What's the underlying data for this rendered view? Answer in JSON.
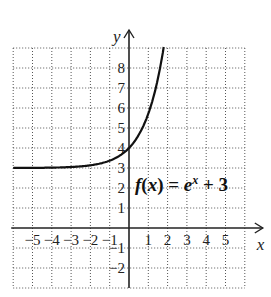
{
  "chart_data": {
    "type": "line",
    "title": "",
    "annotation": "f(x) = e^x + 3",
    "xlabel": "x",
    "ylabel": "y",
    "xlim": [
      -6,
      6
    ],
    "ylim": [
      -3,
      9
    ],
    "grid": true,
    "x_ticks": [
      "-5",
      "-4",
      "-3",
      "-2",
      "-1",
      "1",
      "2",
      "3",
      "4",
      "5"
    ],
    "y_ticks": [
      "8",
      "7",
      "6",
      "5",
      "4",
      "3",
      "2",
      "1",
      "-1",
      "-2"
    ],
    "series": [
      {
        "name": "f(x) = e^x + 3",
        "x": [
          -6,
          -5,
          -4,
          -3,
          -2,
          -1,
          0,
          0.5,
          1,
          1.5,
          1.8
        ],
        "y": [
          3.0,
          3.01,
          3.02,
          3.05,
          3.14,
          3.37,
          4.0,
          4.65,
          5.72,
          7.48,
          9.05
        ]
      }
    ]
  },
  "labels": {
    "fname": "f",
    "paren_open": "(",
    "xvar": "x",
    "paren_close": ")",
    "eq": " = ",
    "base": "e",
    "exp": "x",
    "plus": " + 3",
    "x_axis": "x",
    "y_axis": "y"
  }
}
